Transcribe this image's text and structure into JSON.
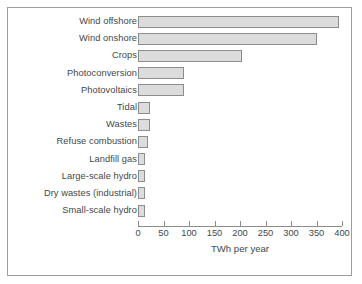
{
  "chart_data": {
    "type": "bar",
    "orientation": "horizontal",
    "title": "",
    "xlabel": "TWh per year",
    "ylabel": "",
    "xlim": [
      0,
      400
    ],
    "xticks": [
      0,
      50,
      100,
      150,
      200,
      250,
      300,
      350,
      400
    ],
    "xtick_labels": [
      "0",
      "50",
      "100",
      "150",
      "200",
      "250",
      "300",
      "350",
      "400"
    ],
    "grid": false,
    "legend": null,
    "categories": [
      "Wind offshore",
      "Wind onshore",
      "Crops",
      "Photoconversion",
      "Photovoltaics",
      "Tidal",
      "Wastes",
      "Refuse combustion",
      "Landfill gas",
      "Large-scale hydro",
      "Dry wastes (industrial)",
      "Small-scale hydro"
    ],
    "values": [
      395,
      350,
      203,
      90,
      90,
      24,
      24,
      20,
      13,
      13,
      13,
      13
    ],
    "bar_fill": "#dcdcdc",
    "bar_edge": "#8d8d8d",
    "axis_color": "#8d8d8d",
    "text_color": "#44484b",
    "frame_color": "#9d9d9d"
  }
}
